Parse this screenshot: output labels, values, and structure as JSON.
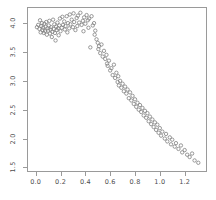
{
  "chart_data": {
    "type": "scatter",
    "title": "",
    "subtitle": "",
    "xlabel": "",
    "ylabel": "",
    "xlim": [
      -0.07,
      1.38
    ],
    "ylim": [
      1.42,
      4.28
    ],
    "grid": false,
    "legend": null,
    "marker": {
      "shape": "open-circle",
      "color": "#808080",
      "size_px": 3.4
    },
    "xticks": [
      0.0,
      0.2,
      0.4,
      0.6,
      0.8,
      1.0,
      1.2
    ],
    "xticklabels": [
      "0.0",
      "0.2",
      "0.4",
      "0.6",
      "0.8",
      "1.0",
      "1.2"
    ],
    "yticks": [
      1.5,
      2.0,
      2.5,
      3.0,
      3.5,
      4.0
    ],
    "yticklabels": [
      "1.5",
      "2.0",
      "2.5",
      "3.0",
      "3.5",
      "4.0"
    ],
    "n_points": 148,
    "series": [
      {
        "name": "observations",
        "x": [
          0.01,
          0.02,
          0.03,
          0.035,
          0.04,
          0.045,
          0.05,
          0.055,
          0.06,
          0.065,
          0.07,
          0.075,
          0.08,
          0.085,
          0.09,
          0.095,
          0.1,
          0.105,
          0.11,
          0.115,
          0.12,
          0.125,
          0.13,
          0.135,
          0.14,
          0.145,
          0.15,
          0.155,
          0.16,
          0.165,
          0.17,
          0.175,
          0.18,
          0.185,
          0.19,
          0.195,
          0.2,
          0.21,
          0.215,
          0.22,
          0.23,
          0.235,
          0.24,
          0.25,
          0.255,
          0.26,
          0.27,
          0.275,
          0.28,
          0.29,
          0.3,
          0.305,
          0.31,
          0.32,
          0.33,
          0.335,
          0.34,
          0.35,
          0.36,
          0.37,
          0.38,
          0.385,
          0.39,
          0.4,
          0.41,
          0.42,
          0.425,
          0.43,
          0.44,
          0.45,
          0.46,
          0.47,
          0.475,
          0.48,
          0.49,
          0.5,
          0.505,
          0.51,
          0.52,
          0.53,
          0.54,
          0.55,
          0.56,
          0.57,
          0.575,
          0.58,
          0.59,
          0.6,
          0.61,
          0.62,
          0.63,
          0.64,
          0.65,
          0.66,
          0.665,
          0.67,
          0.68,
          0.69,
          0.7,
          0.71,
          0.72,
          0.73,
          0.74,
          0.75,
          0.76,
          0.77,
          0.78,
          0.79,
          0.8,
          0.81,
          0.82,
          0.83,
          0.84,
          0.85,
          0.86,
          0.87,
          0.88,
          0.89,
          0.9,
          0.91,
          0.92,
          0.93,
          0.94,
          0.95,
          0.96,
          0.97,
          0.98,
          0.99,
          1.0,
          1.01,
          1.02,
          1.04,
          1.05,
          1.06,
          1.08,
          1.09,
          1.1,
          1.12,
          1.13,
          1.15,
          1.17,
          1.18,
          1.2,
          1.22,
          1.24,
          1.26,
          1.28,
          1.31
        ],
        "y": [
          3.93,
          3.97,
          3.9,
          4.05,
          3.84,
          3.95,
          4.0,
          3.88,
          3.92,
          3.83,
          3.99,
          3.86,
          3.94,
          4.02,
          3.8,
          3.91,
          3.87,
          3.96,
          4.04,
          3.82,
          3.89,
          3.93,
          3.76,
          3.85,
          4.06,
          3.9,
          3.98,
          3.83,
          3.7,
          3.94,
          3.88,
          4.01,
          3.91,
          3.79,
          3.96,
          4.08,
          3.86,
          3.92,
          4.11,
          3.97,
          4.03,
          3.89,
          3.95,
          4.12,
          3.84,
          4.0,
          3.91,
          4.15,
          3.98,
          4.06,
          3.93,
          4.17,
          4.02,
          3.88,
          4.09,
          3.95,
          4.13,
          4.01,
          4.18,
          3.97,
          4.04,
          3.86,
          4.1,
          3.99,
          4.14,
          4.05,
          3.92,
          4.08,
          3.58,
          4.12,
          3.96,
          4.0,
          3.8,
          3.87,
          3.72,
          3.66,
          3.55,
          3.6,
          3.48,
          3.63,
          3.42,
          3.52,
          3.38,
          3.45,
          3.3,
          3.26,
          3.35,
          3.18,
          3.22,
          3.1,
          3.28,
          3.05,
          3.14,
          2.98,
          3.08,
          2.92,
          3.0,
          2.88,
          2.95,
          2.82,
          2.9,
          2.78,
          2.85,
          2.7,
          2.8,
          2.66,
          2.74,
          2.6,
          2.68,
          2.55,
          2.62,
          2.5,
          2.58,
          2.46,
          2.53,
          2.4,
          2.48,
          2.36,
          2.44,
          2.3,
          2.38,
          2.25,
          2.33,
          2.2,
          2.28,
          2.15,
          2.24,
          2.1,
          2.18,
          2.05,
          2.12,
          2.0,
          2.08,
          1.95,
          2.02,
          1.9,
          1.98,
          1.86,
          1.92,
          1.82,
          1.88,
          1.76,
          1.8,
          1.72,
          1.68,
          1.74,
          1.62,
          1.58
        ]
      }
    ]
  }
}
